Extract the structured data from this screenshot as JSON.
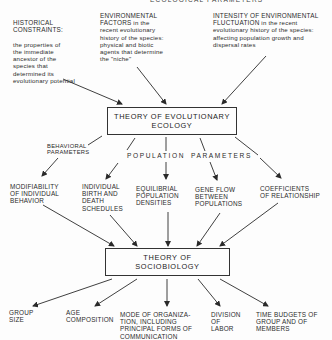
{
  "diagram": {
    "header_cut": "ECOLOGICAL PARAMETERS",
    "inputs": [
      {
        "title": "HISTORICAL\nCONSTRAINTS:",
        "desc": "the properties of\nthe immediate\nancestor of the\nspecies that\ndetermined its\nevolutionary potential"
      },
      {
        "title": "ENVIRONMENTAL\nFACTORS",
        "desc": " in the\nrecent evolutionary\nhistory of the species:\nphysical and biotic\nagents that determine\nthe \"niche\""
      },
      {
        "title": "INTENSITY OF ENVIRONMENTAL\nFLUCTUATION",
        "desc": " in the recent\nevolutionary history of the species:\naffecting population growth and\ndispersal rates"
      }
    ],
    "box_evolutionary": "THEORY OF EVOLUTIONARY\nECOLOGY",
    "labels": {
      "behavioral": "BEHAVIORAL\nPARAMETERS",
      "population": "POPULATION",
      "parameters": "PARAMETERS"
    },
    "parameters": [
      "MODIFIABILITY\nOF INDIVIDUAL\nBEHAVIOR",
      "INDIVIDUAL\nBIRTH AND\nDEATH\nSCHEDULES",
      "EQUILIBRIAL\nPOPULATION\nDENSITIES",
      "GENE FLOW\nBETWEEN\nPOPULATIONS",
      "COEFFICIENTS\nOF RELATIONSHIP"
    ],
    "box_sociobiology": "THEORY OF\nSOCIOBIOLOGY",
    "outputs": [
      "GROUP\nSIZE",
      "AGE\nCOMPOSITION",
      "MODE OF ORGANIZA-\nTION, INCLUDING\nPRINCIPAL FORMS OF\nCOMMUNICATION",
      "DIVISION\nOF\nLABOR",
      "TIME BUDGETS OF\nGROUP AND OF\nMEMBERS"
    ]
  }
}
